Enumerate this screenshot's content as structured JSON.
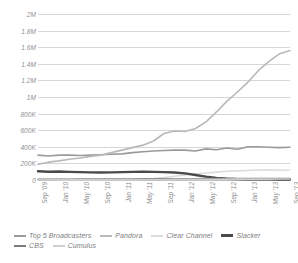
{
  "chart_data": {
    "type": "line",
    "title": "",
    "xlabel": "",
    "ylabel": "",
    "ylim": [
      0,
      2000000
    ],
    "grid": true,
    "legend_position": "bottom-left",
    "ytick_labels": [
      "2M",
      "1.8M",
      "1.6M",
      "1.4M",
      "1.2M",
      "1M",
      "800K",
      "600K",
      "400K",
      "200K",
      "0"
    ],
    "ytick_values": [
      2000000,
      1800000,
      1600000,
      1400000,
      1200000,
      1000000,
      800000,
      600000,
      400000,
      200000,
      0
    ],
    "categories": [
      "Sep '09",
      "Nov '09",
      "Jan '10",
      "Mar '10",
      "May '10",
      "Jul '10",
      "Sep '10",
      "Nov '10",
      "Jan '11",
      "Mar '11",
      "May '11",
      "Jul '11",
      "Sep '11",
      "Nov '11",
      "Jan '12",
      "Mar '12",
      "May '12",
      "Jul '12",
      "Sep '12",
      "Nov '12",
      "Jan '13",
      "Mar '13",
      "May '13",
      "Jul '13",
      "Sep '13"
    ],
    "xtick_labels": [
      "Sep '09",
      "Jan '10",
      "May '10",
      "Sep '10",
      "Jan '11",
      "May '11",
      "Sep '11",
      "Jan '12",
      "May '12",
      "Sep '12",
      "Jan '13",
      "May '13",
      "Sep '13"
    ],
    "series": [
      {
        "name": "Top 5 Broadcasters",
        "color": "#9a9a9a",
        "width": 1.6,
        "values": [
          300000,
          290000,
          300000,
          300000,
          295000,
          300000,
          305000,
          310000,
          315000,
          330000,
          340000,
          350000,
          355000,
          360000,
          360000,
          350000,
          375000,
          365000,
          385000,
          370000,
          400000,
          400000,
          395000,
          390000,
          395000
        ]
      },
      {
        "name": "Pandora",
        "color": "#b9b9b9",
        "width": 1.6,
        "values": [
          190000,
          215000,
          230000,
          250000,
          265000,
          285000,
          300000,
          330000,
          360000,
          390000,
          420000,
          470000,
          560000,
          590000,
          585000,
          620000,
          700000,
          820000,
          950000,
          1060000,
          1180000,
          1320000,
          1430000,
          1520000,
          1560000
        ]
      },
      {
        "name": "Clear Channel",
        "color": "#dcdcdc",
        "width": 1.6,
        "values": [
          6000,
          6000,
          7000,
          7000,
          8000,
          8000,
          9000,
          10000,
          11000,
          12000,
          14000,
          18000,
          30000,
          45000,
          62000,
          75000,
          85000,
          95000,
          105000,
          110000,
          115000,
          120000,
          122000,
          118000,
          120000
        ]
      },
      {
        "name": "Slacker",
        "color": "#4a4a4a",
        "width": 2.4,
        "values": [
          105000,
          100000,
          102000,
          98000,
          95000,
          92000,
          90000,
          92000,
          95000,
          98000,
          100000,
          98000,
          95000,
          90000,
          80000,
          60000,
          40000,
          25000,
          15000,
          10000,
          8000,
          7000,
          7000,
          6000,
          6000
        ]
      },
      {
        "name": "CBS",
        "color": "#7b7b7b",
        "width": 1.6,
        "values": [
          8000,
          8000,
          9000,
          9000,
          10000,
          10000,
          11000,
          11000,
          12000,
          12000,
          13000,
          13000,
          14000,
          14000,
          15000,
          15000,
          16000,
          16000,
          17000,
          17000,
          18000,
          18000,
          18000,
          18000,
          18000
        ]
      },
      {
        "name": "Cumulus",
        "color": "#cfcfcf",
        "width": 1.6,
        "values": [
          3000,
          3000,
          3000,
          4000,
          4000,
          4000,
          4000,
          5000,
          5000,
          5000,
          6000,
          6000,
          6000,
          7000,
          7000,
          8000,
          8000,
          9000,
          9000,
          10000,
          10000,
          11000,
          11000,
          12000,
          12000
        ]
      }
    ]
  },
  "legend": {
    "row1": [
      "Top 5 Broadcasters",
      "Pandora",
      "Clear Channel",
      "Slacker"
    ],
    "row2": [
      "CBS",
      "Cumulus"
    ]
  }
}
